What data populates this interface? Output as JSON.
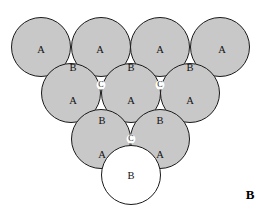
{
  "figure": {
    "panel_label": "B",
    "panel_label_x": 250,
    "panel_label_y": 196,
    "background_color": "#ffffff",
    "shaded_fill_color": "#c8c8c8",
    "open_fill_color": "#ffffff",
    "stroke_color": "#1a1a1a",
    "radius": 29.5
  },
  "shaded_circles": [
    {
      "name": "row1-sphere-1",
      "cx": 41,
      "cy": 47
    },
    {
      "name": "row1-sphere-2",
      "cx": 101,
      "cy": 47
    },
    {
      "name": "row1-sphere-3",
      "cx": 160,
      "cy": 47
    },
    {
      "name": "row1-sphere-4",
      "cx": 220,
      "cy": 47
    },
    {
      "name": "row2-sphere-1",
      "cx": 71,
      "cy": 93
    },
    {
      "name": "row2-sphere-2",
      "cx": 131,
      "cy": 93
    },
    {
      "name": "row2-sphere-3",
      "cx": 190,
      "cy": 93
    },
    {
      "name": "row3-sphere-1",
      "cx": 101,
      "cy": 139
    },
    {
      "name": "row3-sphere-2",
      "cx": 160,
      "cy": 139
    }
  ],
  "open_circles": [
    {
      "name": "bottom-open-sphere",
      "cx": 131,
      "cy": 175
    }
  ],
  "interstitial_holes": [
    {
      "name": "c-hole-left",
      "cx": 101,
      "cy": 85,
      "r": 4.5
    },
    {
      "name": "c-hole-right",
      "cx": 160,
      "cy": 85,
      "r": 4.5
    },
    {
      "name": "c-hole-bottom",
      "cx": 131,
      "cy": 139,
      "r": 4.5
    }
  ],
  "labels": {
    "row_a_top": [
      {
        "text": "A",
        "x": 41,
        "y": 51
      },
      {
        "text": "A",
        "x": 100,
        "y": 51
      },
      {
        "text": "A",
        "x": 160,
        "y": 51
      },
      {
        "text": "A",
        "x": 222,
        "y": 51
      }
    ],
    "row_b_upper": [
      {
        "text": "B",
        "x": 73,
        "y": 69
      },
      {
        "text": "B",
        "x": 131,
        "y": 69
      },
      {
        "text": "B",
        "x": 190,
        "y": 69
      }
    ],
    "row_a_middle": [
      {
        "text": "A",
        "x": 73,
        "y": 102
      },
      {
        "text": "A",
        "x": 131,
        "y": 102
      },
      {
        "text": "A",
        "x": 190,
        "y": 102
      }
    ],
    "row_b_lower": [
      {
        "text": "B",
        "x": 102,
        "y": 122
      },
      {
        "text": "B",
        "x": 160,
        "y": 122
      }
    ],
    "row_a_bottom": [
      {
        "text": "A",
        "x": 102,
        "y": 156
      },
      {
        "text": "A",
        "x": 160,
        "y": 156
      }
    ],
    "row_b_open": [
      {
        "text": "B",
        "x": 131,
        "y": 177
      }
    ],
    "c_sites": [
      {
        "text": "C",
        "x": 101,
        "y": 85
      },
      {
        "text": "C",
        "x": 160,
        "y": 85
      },
      {
        "text": "C",
        "x": 131,
        "y": 139
      }
    ]
  }
}
